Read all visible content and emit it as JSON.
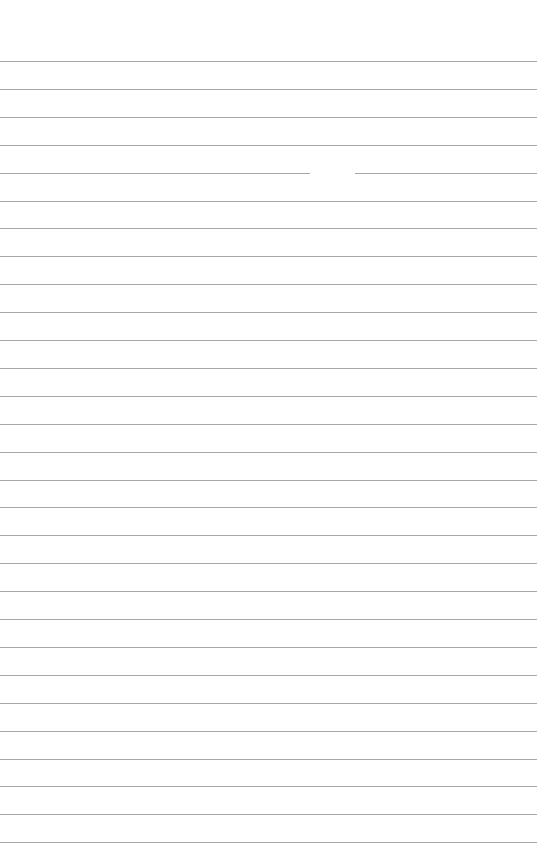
{
  "page": {
    "type": "lined-paper",
    "background": "#ffffff",
    "rule_color": "#8a8a8a",
    "first_rule_y": 61,
    "rule_spacing": 27.9,
    "rule_count": 29,
    "text": ""
  }
}
